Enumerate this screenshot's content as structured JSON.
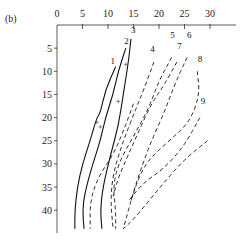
{
  "panel_label": "(b)",
  "chart_data": {
    "type": "line",
    "title": "",
    "xlabel": "",
    "ylabel": "",
    "x_axis_position": "top",
    "y_axis_inverted": true,
    "xlim": [
      0,
      34
    ],
    "ylim": [
      0,
      45
    ],
    "x_ticks": [
      0,
      5,
      10,
      15,
      20,
      25,
      30
    ],
    "y_ticks": [
      5,
      10,
      15,
      20,
      25,
      30,
      35,
      40
    ],
    "grid": false,
    "legend": "inline curve numbers",
    "series": [
      {
        "name": "1",
        "style": "solid",
        "points": [
          [
            11.5,
            9
          ],
          [
            9.5,
            14
          ],
          [
            8.5,
            19
          ],
          [
            7.8,
            20
          ],
          [
            6.5,
            25
          ],
          [
            5,
            30
          ],
          [
            4,
            35
          ],
          [
            3.5,
            40
          ],
          [
            3.5,
            44
          ]
        ]
      },
      {
        "name": "2",
        "style": "solid",
        "points": [
          [
            13.5,
            5
          ],
          [
            12,
            10
          ],
          [
            11,
            15
          ],
          [
            9.5,
            20
          ],
          [
            8.5,
            25
          ],
          [
            7,
            30
          ],
          [
            5.5,
            36
          ],
          [
            5,
            40
          ],
          [
            5.3,
            44
          ]
        ]
      },
      {
        "name": "3",
        "style": "solid",
        "points": [
          [
            14.5,
            3
          ],
          [
            14,
            8
          ],
          [
            13,
            15
          ],
          [
            12,
            22
          ],
          [
            10.5,
            28
          ],
          [
            9,
            35
          ],
          [
            8.5,
            40
          ],
          [
            8.8,
            44
          ]
        ]
      },
      {
        "name": "3b",
        "style": "dashed",
        "points": [
          [
            15,
            17
          ],
          [
            13,
            23
          ],
          [
            11,
            28
          ],
          [
            8,
            33
          ],
          [
            6.5,
            38
          ],
          [
            6.5,
            44
          ]
        ]
      },
      {
        "name": "4",
        "style": "dashed",
        "points": [
          [
            19,
            8
          ],
          [
            17,
            14
          ],
          [
            15.5,
            18
          ],
          [
            13,
            25
          ],
          [
            11,
            32
          ],
          [
            10.5,
            38
          ],
          [
            11,
            44
          ]
        ]
      },
      {
        "name": "5",
        "style": "dashed",
        "points": [
          [
            22.5,
            7
          ],
          [
            20,
            12
          ],
          [
            18,
            18
          ],
          [
            15,
            24
          ],
          [
            12,
            30
          ],
          [
            11,
            35
          ],
          [
            11.5,
            40
          ],
          [
            11.5,
            44
          ]
        ]
      },
      {
        "name": "7",
        "style": "dashed",
        "points": [
          [
            23.5,
            8
          ],
          [
            21,
            13
          ],
          [
            18.5,
            17
          ],
          [
            16,
            23
          ],
          [
            14,
            28
          ],
          [
            12,
            33
          ],
          [
            11,
            37
          ]
        ]
      },
      {
        "name": "6",
        "style": "dashed",
        "points": [
          [
            25.5,
            7
          ],
          [
            23,
            13
          ],
          [
            21,
            19
          ],
          [
            18.5,
            25
          ],
          [
            16.5,
            31
          ],
          [
            15,
            36
          ],
          [
            13.5,
            42
          ],
          [
            13,
            44
          ]
        ]
      },
      {
        "name": "8",
        "style": "dashed",
        "points": [
          [
            27.5,
            10
          ],
          [
            28,
            15
          ],
          [
            26,
            21
          ],
          [
            22,
            25
          ],
          [
            18,
            29
          ],
          [
            16,
            33
          ],
          [
            14.5,
            38
          ]
        ]
      },
      {
        "name": "9",
        "style": "dashed",
        "points": [
          [
            28,
            20
          ],
          [
            25,
            26
          ],
          [
            21,
            31
          ],
          [
            17,
            34
          ],
          [
            14,
            38
          ]
        ]
      },
      {
        "name": "10",
        "style": "dashed",
        "points": [
          [
            29.5,
            25
          ],
          [
            25,
            29
          ],
          [
            21,
            34
          ],
          [
            18,
            38
          ],
          [
            15,
            42
          ],
          [
            13,
            44
          ]
        ]
      }
    ]
  }
}
